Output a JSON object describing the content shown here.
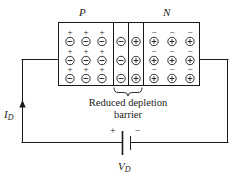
{
  "figure": {
    "type": "pn-junction-forward-bias-diagram",
    "regions": [
      {
        "name": "p-region",
        "label": "P",
        "columns": 3,
        "rows": 3,
        "cell_top_sign": "+",
        "cell_circle_sign": "−"
      },
      {
        "name": "depletion-negative-column",
        "label": "",
        "columns": 1,
        "rows": 3,
        "cell_top_sign": "",
        "cell_circle_sign": "−"
      },
      {
        "name": "depletion-positive-column",
        "label": "",
        "columns": 1,
        "rows": 3,
        "cell_top_sign": "",
        "cell_circle_sign": "+"
      },
      {
        "name": "n-region",
        "label": "N",
        "columns": 3,
        "rows": 3,
        "cell_top_sign": "−",
        "cell_circle_sign": "+"
      }
    ],
    "p_label": "P",
    "n_label": "N",
    "caption_line1": "Reduced depletion",
    "caption_line2": "barrier",
    "current_label": "I",
    "current_subscript": "D",
    "source_label": "V",
    "source_subscript": "D",
    "battery_positive_sign": "+",
    "battery_negative_sign": "−",
    "colors": {
      "line": "#1a1a1a",
      "background": "#ffffff",
      "text": "#1a1a1a"
    }
  }
}
